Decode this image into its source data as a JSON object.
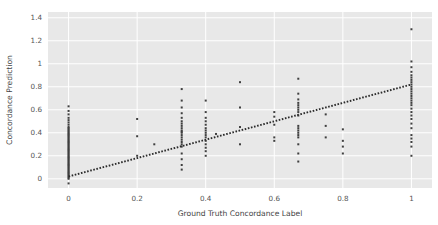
{
  "chart_data": {
    "type": "scatter",
    "title": "",
    "xlabel": "Ground Truth Concordance Label",
    "ylabel": "Concordance Prediction",
    "xlim": [
      -0.06,
      1.06
    ],
    "ylim": [
      -0.08,
      1.45
    ],
    "xticks": [
      0,
      0.2,
      0.4,
      0.6,
      0.8,
      1
    ],
    "xticklabels": [
      "0",
      "0.2",
      "0.4",
      "0.6",
      "0.8",
      "1"
    ],
    "yticks": [
      0,
      0.2,
      0.4,
      0.6,
      0.8,
      1.0,
      1.2,
      1.4
    ],
    "yticklabels": [
      "0",
      "0.2",
      "0.4",
      "0.6",
      "0.8",
      "1",
      "1.2",
      "1.4"
    ],
    "grid": true,
    "grid_color": "#ffffff",
    "plot_bg": "#e8e8e8",
    "figure_bg": "#ffffff",
    "marker_color": "#3f3f3f",
    "marker_size": 2.0,
    "legend": null,
    "legend_position": "none",
    "trendline": {
      "style": "dotted",
      "color": "#2b2b2b",
      "x_start": 0.0,
      "y_start": 0.02,
      "x_end": 1.0,
      "y_end": 0.82
    },
    "series": [
      {
        "name": "samples",
        "points": [
          [
            0.0,
            -0.04
          ],
          [
            0.0,
            0.0
          ],
          [
            0.0,
            0.01
          ],
          [
            0.0,
            0.02
          ],
          [
            0.0,
            0.03
          ],
          [
            0.0,
            0.04
          ],
          [
            0.0,
            0.05
          ],
          [
            0.0,
            0.06
          ],
          [
            0.0,
            0.07
          ],
          [
            0.0,
            0.08
          ],
          [
            0.0,
            0.09
          ],
          [
            0.0,
            0.1
          ],
          [
            0.0,
            0.11
          ],
          [
            0.0,
            0.12
          ],
          [
            0.0,
            0.13
          ],
          [
            0.0,
            0.14
          ],
          [
            0.0,
            0.15
          ],
          [
            0.0,
            0.16
          ],
          [
            0.0,
            0.17
          ],
          [
            0.0,
            0.18
          ],
          [
            0.0,
            0.19
          ],
          [
            0.0,
            0.2
          ],
          [
            0.0,
            0.21
          ],
          [
            0.0,
            0.22
          ],
          [
            0.0,
            0.23
          ],
          [
            0.0,
            0.24
          ],
          [
            0.0,
            0.25
          ],
          [
            0.0,
            0.26
          ],
          [
            0.0,
            0.27
          ],
          [
            0.0,
            0.28
          ],
          [
            0.0,
            0.29
          ],
          [
            0.0,
            0.3
          ],
          [
            0.0,
            0.31
          ],
          [
            0.0,
            0.32
          ],
          [
            0.0,
            0.33
          ],
          [
            0.0,
            0.34
          ],
          [
            0.0,
            0.35
          ],
          [
            0.0,
            0.36
          ],
          [
            0.0,
            0.37
          ],
          [
            0.0,
            0.38
          ],
          [
            0.0,
            0.39
          ],
          [
            0.0,
            0.4
          ],
          [
            0.0,
            0.41
          ],
          [
            0.0,
            0.42
          ],
          [
            0.0,
            0.43
          ],
          [
            0.0,
            0.44
          ],
          [
            0.0,
            0.45
          ],
          [
            0.0,
            0.47
          ],
          [
            0.0,
            0.49
          ],
          [
            0.0,
            0.51
          ],
          [
            0.0,
            0.53
          ],
          [
            0.0,
            0.56
          ],
          [
            0.0,
            0.59
          ],
          [
            0.0,
            0.63
          ],
          [
            0.2,
            0.2
          ],
          [
            0.2,
            0.37
          ],
          [
            0.2,
            0.52
          ],
          [
            0.25,
            0.3
          ],
          [
            0.33,
            0.08
          ],
          [
            0.33,
            0.12
          ],
          [
            0.33,
            0.17
          ],
          [
            0.33,
            0.22
          ],
          [
            0.33,
            0.28
          ],
          [
            0.33,
            0.3
          ],
          [
            0.33,
            0.32
          ],
          [
            0.33,
            0.34
          ],
          [
            0.33,
            0.36
          ],
          [
            0.33,
            0.38
          ],
          [
            0.33,
            0.4
          ],
          [
            0.33,
            0.41
          ],
          [
            0.33,
            0.42
          ],
          [
            0.33,
            0.44
          ],
          [
            0.33,
            0.46
          ],
          [
            0.33,
            0.48
          ],
          [
            0.33,
            0.5
          ],
          [
            0.33,
            0.53
          ],
          [
            0.33,
            0.57
          ],
          [
            0.33,
            0.62
          ],
          [
            0.33,
            0.68
          ],
          [
            0.33,
            0.78
          ],
          [
            0.4,
            0.2
          ],
          [
            0.4,
            0.24
          ],
          [
            0.4,
            0.27
          ],
          [
            0.4,
            0.3
          ],
          [
            0.4,
            0.33
          ],
          [
            0.4,
            0.36
          ],
          [
            0.4,
            0.38
          ],
          [
            0.4,
            0.4
          ],
          [
            0.4,
            0.42
          ],
          [
            0.4,
            0.44
          ],
          [
            0.4,
            0.47
          ],
          [
            0.4,
            0.5
          ],
          [
            0.4,
            0.53
          ],
          [
            0.4,
            0.58
          ],
          [
            0.4,
            0.68
          ],
          [
            0.43,
            0.39
          ],
          [
            0.5,
            0.3
          ],
          [
            0.5,
            0.45
          ],
          [
            0.5,
            0.62
          ],
          [
            0.5,
            0.84
          ],
          [
            0.6,
            0.33
          ],
          [
            0.6,
            0.36
          ],
          [
            0.6,
            0.47
          ],
          [
            0.6,
            0.54
          ],
          [
            0.6,
            0.58
          ],
          [
            0.67,
            0.15
          ],
          [
            0.67,
            0.22
          ],
          [
            0.67,
            0.3
          ],
          [
            0.67,
            0.36
          ],
          [
            0.67,
            0.38
          ],
          [
            0.67,
            0.4
          ],
          [
            0.67,
            0.42
          ],
          [
            0.67,
            0.44
          ],
          [
            0.67,
            0.46
          ],
          [
            0.67,
            0.55
          ],
          [
            0.67,
            0.58
          ],
          [
            0.67,
            0.6
          ],
          [
            0.67,
            0.62
          ],
          [
            0.67,
            0.64
          ],
          [
            0.67,
            0.66
          ],
          [
            0.67,
            0.69
          ],
          [
            0.67,
            0.74
          ],
          [
            0.67,
            0.87
          ],
          [
            0.75,
            0.36
          ],
          [
            0.75,
            0.46
          ],
          [
            0.75,
            0.56
          ],
          [
            0.8,
            0.22
          ],
          [
            0.8,
            0.28
          ],
          [
            0.8,
            0.33
          ],
          [
            0.8,
            0.43
          ],
          [
            1.0,
            0.2
          ],
          [
            1.0,
            0.28
          ],
          [
            1.0,
            0.32
          ],
          [
            1.0,
            0.35
          ],
          [
            1.0,
            0.38
          ],
          [
            1.0,
            0.44
          ],
          [
            1.0,
            0.48
          ],
          [
            1.0,
            0.52
          ],
          [
            1.0,
            0.55
          ],
          [
            1.0,
            0.58
          ],
          [
            1.0,
            0.61
          ],
          [
            1.0,
            0.64
          ],
          [
            1.0,
            0.66
          ],
          [
            1.0,
            0.68
          ],
          [
            1.0,
            0.7
          ],
          [
            1.0,
            0.72
          ],
          [
            1.0,
            0.74
          ],
          [
            1.0,
            0.76
          ],
          [
            1.0,
            0.78
          ],
          [
            1.0,
            0.8
          ],
          [
            1.0,
            0.82
          ],
          [
            1.0,
            0.84
          ],
          [
            1.0,
            0.86
          ],
          [
            1.0,
            0.88
          ],
          [
            1.0,
            0.9
          ],
          [
            1.0,
            0.93
          ],
          [
            1.0,
            0.97
          ],
          [
            1.0,
            1.02
          ],
          [
            1.0,
            1.3
          ]
        ]
      }
    ]
  }
}
